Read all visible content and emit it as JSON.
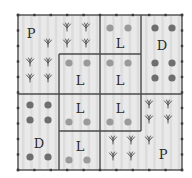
{
  "diagram": {
    "type": "field-plot-layout",
    "grid": {
      "cols": 10,
      "rows": 10
    },
    "outer": {
      "x": 18,
      "y": 15,
      "w": 164,
      "h": 155
    },
    "colors": {
      "background": "#e9e9e9",
      "stripe": "#dcdcdc",
      "border": "#4a4a4a",
      "tick": "#3a3a3a",
      "dot_dark": "#6e6e6e",
      "dot_light": "#9a9a9a",
      "plant": "#555555"
    },
    "regions": [
      {
        "id": "p-top-left",
        "label": "P",
        "label_pos": [
          31,
          33
        ],
        "kind": "plants"
      },
      {
        "id": "l-top-left",
        "label": "L",
        "x": 59,
        "y": 54,
        "w": 41,
        "h": 40,
        "label_pos": [
          80,
          80
        ],
        "kind": "light-dots"
      },
      {
        "id": "l-top-mid-upper",
        "label": "L",
        "x": 100,
        "y": 15,
        "w": 41,
        "h": 39,
        "label_pos": [
          120,
          43
        ],
        "kind": "light-dots"
      },
      {
        "id": "l-top-mid-lower",
        "label": "L",
        "x": 100,
        "y": 54,
        "w": 41,
        "h": 40,
        "label_pos": [
          120,
          80
        ],
        "kind": "light-dots"
      },
      {
        "id": "d-top-right",
        "label": "D",
        "x": 141,
        "y": 15,
        "w": 41,
        "h": 79,
        "label_pos": [
          162,
          45
        ],
        "kind": "dark-dots"
      },
      {
        "id": "d-bottom-left",
        "label": "D",
        "x": 18,
        "y": 94,
        "w": 41,
        "h": 76,
        "label_pos": [
          39,
          143
        ],
        "kind": "dark-dots"
      },
      {
        "id": "l-bottom-left-upper",
        "label": "L",
        "x": 59,
        "y": 94,
        "w": 41,
        "h": 37,
        "label_pos": [
          80,
          108
        ],
        "kind": "light-dots"
      },
      {
        "id": "l-bottom-left-lower",
        "label": "L",
        "x": 59,
        "y": 131,
        "w": 41,
        "h": 39,
        "label_pos": [
          80,
          146
        ],
        "kind": "light-dots"
      },
      {
        "id": "l-bottom-mid",
        "label": "L",
        "x": 100,
        "y": 94,
        "w": 41,
        "h": 37,
        "label_pos": [
          120,
          108
        ],
        "kind": "light-dots"
      },
      {
        "id": "p-bottom-right",
        "label": "P",
        "label_pos": [
          163,
          154
        ],
        "kind": "plants"
      }
    ],
    "dark_dots": [
      [
        30,
        105
      ],
      [
        48,
        105
      ],
      [
        30,
        120
      ],
      [
        48,
        120
      ],
      [
        30,
        157
      ],
      [
        48,
        157
      ],
      [
        155,
        28
      ],
      [
        172,
        28
      ],
      [
        155,
        63
      ],
      [
        172,
        63
      ],
      [
        155,
        78
      ],
      [
        172,
        78
      ]
    ],
    "light_dots": [
      [
        69,
        63
      ],
      [
        87,
        63
      ],
      [
        110,
        28
      ],
      [
        128,
        28
      ],
      [
        110,
        63
      ],
      [
        128,
        63
      ],
      [
        69,
        122
      ],
      [
        87,
        122
      ],
      [
        69,
        160
      ],
      [
        87,
        160
      ],
      [
        110,
        122
      ],
      [
        128,
        122
      ]
    ],
    "plants": [
      [
        67,
        27
      ],
      [
        86,
        27
      ],
      [
        48,
        43
      ],
      [
        67,
        43
      ],
      [
        86,
        43
      ],
      [
        30,
        62
      ],
      [
        48,
        62
      ],
      [
        30,
        78
      ],
      [
        48,
        78
      ],
      [
        149,
        104
      ],
      [
        168,
        104
      ],
      [
        149,
        119
      ],
      [
        168,
        119
      ],
      [
        113,
        140
      ],
      [
        131,
        140
      ],
      [
        149,
        140
      ],
      [
        113,
        156
      ],
      [
        131,
        156
      ]
    ],
    "lines": [
      {
        "x1": 100,
        "y1": 15,
        "x2": 100,
        "y2": 170
      },
      {
        "x1": 18,
        "y1": 94,
        "x2": 182,
        "y2": 94
      },
      {
        "x1": 59,
        "y1": 54,
        "x2": 100,
        "y2": 54
      },
      {
        "x1": 59,
        "y1": 54,
        "x2": 59,
        "y2": 170
      },
      {
        "x1": 100,
        "y1": 54,
        "x2": 141,
        "y2": 54
      },
      {
        "x1": 141,
        "y1": 15,
        "x2": 141,
        "y2": 131
      },
      {
        "x1": 59,
        "y1": 131,
        "x2": 141,
        "y2": 131
      }
    ]
  }
}
